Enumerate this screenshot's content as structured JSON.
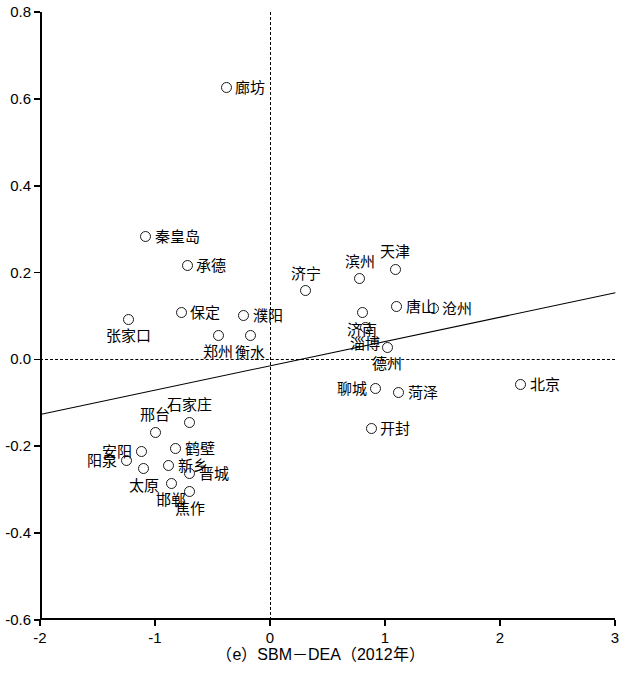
{
  "chart_data": {
    "type": "scatter",
    "title": "（e）SBM－DEA（2012年）",
    "xlabel": "（e）SBM－DEA（2012年）",
    "ylabel": "",
    "xlim": [
      -2,
      3
    ],
    "ylim": [
      -0.6,
      0.8
    ],
    "xticks": [
      -2,
      -1,
      0,
      1,
      2,
      3
    ],
    "xtick_labels": [
      "-2",
      "-1",
      "0",
      "1",
      "2",
      "3"
    ],
    "yticks": [
      -0.6,
      -0.4,
      -0.2,
      0.0,
      0.2,
      0.4,
      0.6,
      0.8
    ],
    "ytick_labels": [
      "-0.6",
      "-0.4",
      "-0.2",
      "0.0",
      "0.2",
      "0.4",
      "0.6",
      "0.8"
    ],
    "grid": false,
    "legend": null,
    "reference_lines": [
      {
        "type": "vertical",
        "value": 0,
        "style": "dashed"
      },
      {
        "type": "horizontal",
        "value": 0,
        "style": "dashed"
      }
    ],
    "trendline": {
      "type": "linear",
      "x0": -2,
      "y0": -0.125,
      "x1": 3,
      "y1": 0.155,
      "style": "solid"
    },
    "points": [
      {
        "label": "廊坊",
        "x": -0.38,
        "y": 0.627,
        "label_pos": "right"
      },
      {
        "label": "秦皇岛",
        "x": -1.08,
        "y": 0.282,
        "label_pos": "right"
      },
      {
        "label": "承德",
        "x": -0.72,
        "y": 0.216,
        "label_pos": "right"
      },
      {
        "label": "天津",
        "x": 1.09,
        "y": 0.208,
        "label_pos": "above"
      },
      {
        "label": "滨州",
        "x": 0.78,
        "y": 0.186,
        "label_pos": "above"
      },
      {
        "label": "济宁",
        "x": 0.31,
        "y": 0.158,
        "label_pos": "above"
      },
      {
        "label": "唐山",
        "x": 1.1,
        "y": 0.122,
        "label_pos": "right"
      },
      {
        "label": "沧州",
        "x": 1.42,
        "y": 0.118,
        "label_pos": "right"
      },
      {
        "label": "保定",
        "x": -0.77,
        "y": 0.107,
        "label_pos": "right"
      },
      {
        "label": "濮阳",
        "x": -0.23,
        "y": 0.102,
        "label_pos": "right"
      },
      {
        "label": "济南",
        "x": 0.8,
        "y": 0.108,
        "label_pos": "below"
      },
      {
        "label": "淄博",
        "x": 0.83,
        "y": 0.074,
        "label_pos": "below"
      },
      {
        "label": "张家口",
        "x": -1.23,
        "y": 0.092,
        "label_pos": "below"
      },
      {
        "label": "郑州",
        "x": -0.45,
        "y": 0.056,
        "label_pos": "below"
      },
      {
        "label": "衡水",
        "x": -0.17,
        "y": 0.055,
        "label_pos": "below"
      },
      {
        "label": "德州",
        "x": 1.02,
        "y": 0.028,
        "label_pos": "below"
      },
      {
        "label": "聊城",
        "x": 0.92,
        "y": -0.068,
        "label_pos": "left"
      },
      {
        "label": "菏泽",
        "x": 1.12,
        "y": -0.075,
        "label_pos": "right"
      },
      {
        "label": "北京",
        "x": 2.18,
        "y": -0.058,
        "label_pos": "right"
      },
      {
        "label": "开封",
        "x": 0.88,
        "y": -0.158,
        "label_pos": "right"
      },
      {
        "label": "石家庄",
        "x": -0.7,
        "y": -0.145,
        "label_pos": "above"
      },
      {
        "label": "邢台",
        "x": -1.0,
        "y": -0.168,
        "label_pos": "above"
      },
      {
        "label": "鹤壁",
        "x": -0.82,
        "y": -0.205,
        "label_pos": "right"
      },
      {
        "label": "安阳",
        "x": -1.12,
        "y": -0.212,
        "label_pos": "left"
      },
      {
        "label": "阳泉",
        "x": -1.25,
        "y": -0.232,
        "label_pos": "left"
      },
      {
        "label": "新乡",
        "x": -0.88,
        "y": -0.244,
        "label_pos": "right"
      },
      {
        "label": "太原",
        "x": -1.1,
        "y": -0.252,
        "label_pos": "below"
      },
      {
        "label": "晋城",
        "x": -0.7,
        "y": -0.262,
        "label_pos": "right"
      },
      {
        "label": "邯郸",
        "x": -0.86,
        "y": -0.285,
        "label_pos": "below"
      },
      {
        "label": "焦作",
        "x": -0.7,
        "y": -0.305,
        "label_pos": "below"
      }
    ]
  },
  "axis": {
    "x_title": "（e）SBM－DEA（2012年）"
  }
}
